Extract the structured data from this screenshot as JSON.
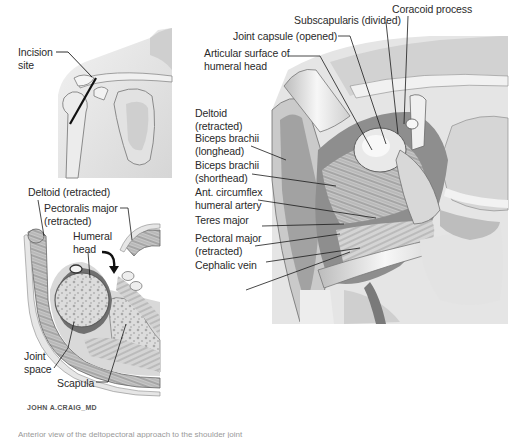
{
  "figure": {
    "panels": [
      {
        "id": "shoulder-surface-view",
        "labels": [
          {
            "text_lines": [
              "Incision",
              "site"
            ]
          }
        ]
      },
      {
        "id": "cross-section-view",
        "labels": [
          {
            "text_lines": [
              "Deltoid (retracted)"
            ]
          },
          {
            "text_lines": [
              "Pectoralis major",
              "(retracted)"
            ]
          },
          {
            "text_lines": [
              "Humeral",
              "head"
            ]
          },
          {
            "text_lines": [
              "Joint",
              "space"
            ]
          },
          {
            "text_lines": [
              "Scapula"
            ]
          }
        ]
      },
      {
        "id": "operative-dissection-view",
        "labels": [
          {
            "text_lines": [
              "Coracoid process"
            ]
          },
          {
            "text_lines": [
              "Subscapularis (divided)"
            ]
          },
          {
            "text_lines": [
              "Joint capsule (opened)"
            ]
          },
          {
            "text_lines": [
              "Articular surface of",
              "humeral head"
            ]
          },
          {
            "text_lines": [
              "Deltoid",
              "(retracted)"
            ]
          },
          {
            "text_lines": [
              "Biceps brachii",
              "(longhead)"
            ]
          },
          {
            "text_lines": [
              "Biceps brachii",
              "(shorthead)"
            ]
          },
          {
            "text_lines": [
              "Ant. circumflex",
              "humeral artery"
            ]
          },
          {
            "text_lines": [
              "Teres major"
            ]
          },
          {
            "text_lines": [
              "Pectoral major",
              "(retracted)"
            ]
          },
          {
            "text_lines": [
              "Cephalic vein"
            ]
          }
        ]
      }
    ],
    "signature": "JOHN A.CRAIG_MD",
    "caption_partial": "Anterior view of the deltopectoral approach to the shoulder joint"
  },
  "colors": {
    "background": "#ffffff",
    "label_text": "#2a2a2a",
    "leader_line": "#1a1a1a",
    "tissue_light": "#e6e6e6",
    "tissue_mid": "#bdbdbd",
    "tissue_dark": "#6e6e6e"
  }
}
